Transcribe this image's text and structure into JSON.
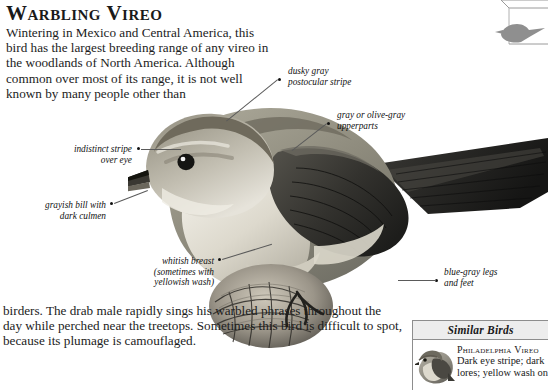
{
  "page": {
    "title": "Warbling Vireo"
  },
  "intro": {
    "text": "Wintering in Mexico and Central America, this bird has the largest breeding range of any vireo in the woodlands of North America. Although common over most of its range, it is not well known by many people other than"
  },
  "outro": {
    "text": "birders. The drab male rapidly sings his warbled phrases throughout the day while perched near the treetops. Sometimes this bird is difficult to spot, because its plumage is camouflaged."
  },
  "callouts": [
    {
      "id": "postocular-stripe",
      "text": "dusky gray\npostocular stripe"
    },
    {
      "id": "upperparts",
      "text": "gray or olive-gray\nupperparts"
    },
    {
      "id": "eye-stripe",
      "text": "indistinct stripe\nover eye"
    },
    {
      "id": "bill",
      "text": "grayish bill with\ndark culmen"
    },
    {
      "id": "breast",
      "text": "whitish breast\n(sometimes with\nyellowish wash)"
    },
    {
      "id": "legs",
      "text": "blue-gray legs\nand feet"
    }
  ],
  "similar_birds": {
    "header": "Similar Birds",
    "entries": [
      {
        "name": "Philadelphia Vireo",
        "description": "Dark eye stripe; dark lores; yellow wash on"
      }
    ]
  },
  "colors": {
    "paper": "#ffffff",
    "ink": "#1a1a1a",
    "leader_line": "#5a5a5a",
    "box_border": "#8d8d8d",
    "box_header_fill": "#ededed",
    "plumage_back": "#8b8madd",
    "plumage_crown": "#7a7568",
    "plumage_breast": "#e4e1d8",
    "plumage_wing_dark": "#3a3a38",
    "silhouette": "#9a9a9a"
  }
}
